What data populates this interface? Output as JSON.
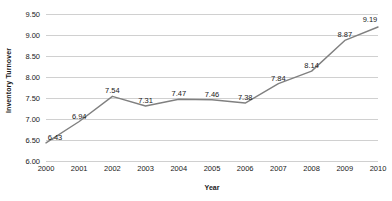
{
  "chart_data": {
    "type": "line",
    "title": "",
    "xlabel": "Year",
    "ylabel": "Inventory Turnover",
    "categories": [
      "2000",
      "2001",
      "2002",
      "2003",
      "2004",
      "2005",
      "2006",
      "2007",
      "2008",
      "2009",
      "2010"
    ],
    "values": [
      6.43,
      6.94,
      7.54,
      7.31,
      7.47,
      7.46,
      7.38,
      7.84,
      8.14,
      8.87,
      9.19
    ],
    "data_labels": [
      "6.43",
      "6.94",
      "7.54",
      "7.31",
      "7.47",
      "7.46",
      "7.38",
      "7.84",
      "8.14",
      "8.87",
      "9.19"
    ],
    "ylim": [
      6.0,
      9.5
    ],
    "y_ticks": [
      6.0,
      6.5,
      7.0,
      7.5,
      8.0,
      8.5,
      9.0,
      9.5
    ],
    "y_tick_labels": [
      "6.00",
      "6.50",
      "7.00",
      "7.50",
      "8.00",
      "8.50",
      "9.00",
      "9.50"
    ],
    "grid": true,
    "legend": false,
    "legend_position": "none",
    "series": [
      {
        "name": "Inventory Turnover",
        "values": [
          6.43,
          6.94,
          7.54,
          7.31,
          7.47,
          7.46,
          7.38,
          7.84,
          8.14,
          8.87,
          9.19
        ],
        "color": "#808080"
      }
    ],
    "colors": {
      "line": "#808080",
      "gridline": "#d0d0d0",
      "text": "#1a1a1a",
      "background": "#ffffff"
    }
  }
}
